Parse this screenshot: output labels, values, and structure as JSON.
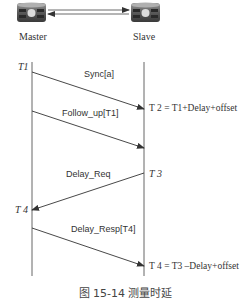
{
  "diagram": {
    "nodes": {
      "master": {
        "label": "Master",
        "icon": "router-icon"
      },
      "slave": {
        "label": "Slave",
        "icon": "router-icon"
      }
    },
    "timestamps": {
      "t1": "T1",
      "t2": "T 2 = T1+Delay+offset",
      "t3": "T 3",
      "t4_master": "T 4",
      "t4_slave": "T 4 = T3  –Delay+offset"
    },
    "messages": [
      {
        "label": "Sync[a]",
        "from": "master",
        "to": "slave"
      },
      {
        "label": "Follow_up[T1]",
        "from": "master",
        "to": "slave"
      },
      {
        "label": "Delay_Req",
        "from": "slave",
        "to": "master"
      },
      {
        "label": "Delay_Resp[T4]",
        "from": "master",
        "to": "slave"
      }
    ],
    "caption": "图 15-14    测量时延"
  }
}
